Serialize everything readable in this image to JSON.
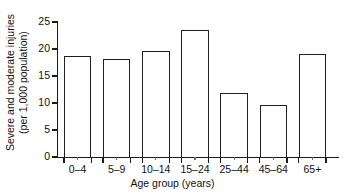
{
  "chart_data": {
    "type": "bar",
    "title": "",
    "xlabel": "Age group (years)",
    "ylabel_line1": "Severe and moderate injuries",
    "ylabel_line2": "(per 1,000 population)",
    "categories": [
      "0–4",
      "5–9",
      "10–14",
      "15–24",
      "25–44",
      "45–64",
      "65+"
    ],
    "values": [
      18.7,
      18.2,
      19.6,
      23.6,
      11.9,
      9.6,
      19.0
    ],
    "ylim": [
      0,
      25
    ],
    "yticks": [
      0,
      5,
      10,
      15,
      20,
      25
    ],
    "ytick_labels": [
      "0",
      "5",
      "10",
      "15",
      "20",
      "25"
    ],
    "grid": false,
    "legend": null,
    "bar_fill_color": "#ffffff",
    "bar_edge_color": "#1f1f1f",
    "axis_color": "#1a1a1a",
    "background_color": "#ffffff"
  }
}
